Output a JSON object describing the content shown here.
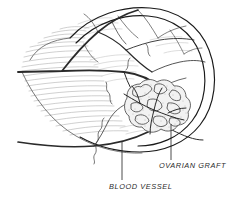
{
  "figure": {
    "medium": "pen-and-ink line drawing with stipple shading",
    "background_color": "#ffffff",
    "ink_color": "#1a1a1a",
    "fine_line_color": "#8e8e8e",
    "stipple_color": "#9a9a9a",
    "label_color": "#2b2b2b"
  },
  "labels": [
    {
      "id": "ovarian-graft",
      "text": "OVARIAN GRAFT",
      "x": 159,
      "y": 165,
      "leader_from": {
        "x": 171,
        "y": 160
      },
      "leader_to": {
        "x": 171,
        "y": 124
      }
    },
    {
      "id": "blood-vessel",
      "text": "BLOOD VESSEL",
      "x": 109,
      "y": 186,
      "leader_from": {
        "x": 122,
        "y": 180
      },
      "leader_to": {
        "x": 122,
        "y": 142
      }
    }
  ],
  "structures": [
    {
      "name": "organ-outline",
      "description": "rounded ovoid body occupying center-right"
    },
    {
      "name": "feathered-margin",
      "description": "fine hatched fringe along left edge"
    },
    {
      "name": "vascular-tree",
      "description": "branching blood vessels across the surface"
    },
    {
      "name": "ovarian-graft-mass",
      "description": "stippled lobulated graft, lower right of center"
    },
    {
      "name": "major-vessel-trunk",
      "description": "thick dark vessel running left to right"
    }
  ]
}
